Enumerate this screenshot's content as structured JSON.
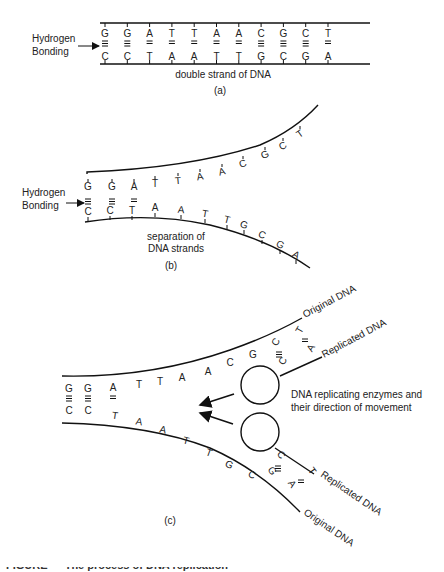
{
  "panel_a": {
    "label": "(a)",
    "hbond_label_line1": "Hydrogen",
    "hbond_label_line2": "Bonding",
    "strand_caption": "double strand of DNA",
    "top_bases": [
      "G",
      "G",
      "A",
      "T",
      "T",
      "A",
      "A",
      "C",
      "G",
      "C",
      "T"
    ],
    "bottom_bases": [
      "C",
      "C",
      "T",
      "A",
      "A",
      "T",
      "T",
      "G",
      "C",
      "G",
      "A"
    ]
  },
  "panel_b": {
    "label": "(b)",
    "hbond_label_line1": "Hydrogen",
    "hbond_label_line2": "Bonding",
    "caption_line1": "separation of",
    "caption_line2": "DNA strands",
    "top_bases": [
      "G",
      "G",
      "A",
      "T",
      "T",
      "A",
      "A",
      "C",
      "G",
      "C",
      "T"
    ],
    "bottom_bases": [
      "C",
      "C",
      "T",
      "A",
      "A",
      "T",
      "T",
      "G",
      "C",
      "G",
      "A"
    ]
  },
  "panel_c": {
    "label": "(c)",
    "original_dna_top": "Original DNA",
    "replicated_dna_top": "Replicated DNA",
    "original_dna_bottom": "Original DNA",
    "replicated_dna_bottom": "Replicated DNA",
    "enzyme_label_line1": "DNA replicating enzymes and",
    "enzyme_label_line2": "their direction of movement",
    "top_bases": [
      "G",
      "G",
      "A",
      "T",
      "T",
      "A",
      "A",
      "C",
      "G",
      "C",
      "T"
    ],
    "bottom_bases": [
      "C",
      "C",
      "T",
      "A",
      "A",
      "T",
      "T",
      "G",
      "C",
      "G",
      "A"
    ],
    "top_replicated": [
      "C",
      "A"
    ],
    "bottom_replicated": [
      "C",
      "T"
    ]
  },
  "figure_caption": "FIGURE — The process of DNA replication"
}
